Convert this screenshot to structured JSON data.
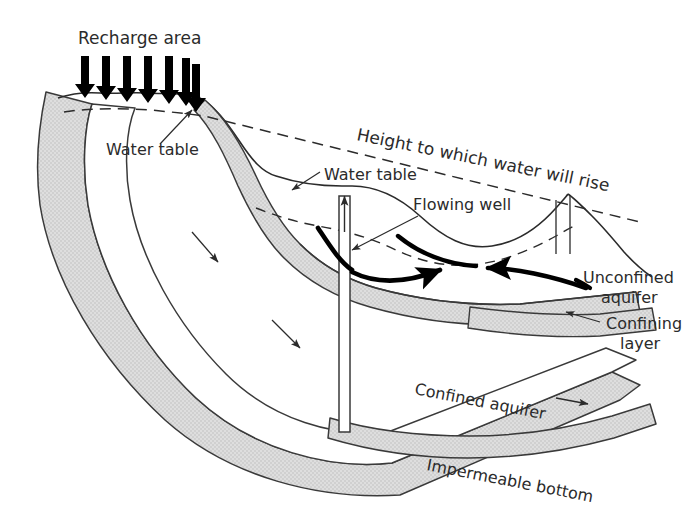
{
  "figure": {
    "kind": "geologic-cross-section",
    "canvas": {
      "width": 697,
      "height": 524
    }
  },
  "colors": {
    "background": "#ffffff",
    "ink": "#1a1a1a",
    "text": "#2b2b2b",
    "confining_layer_fill": "#dcdcdc",
    "confining_layer_stroke": "#3a3a3a",
    "aquifer_fill": "#ffffff",
    "dashed_line": "#2b2b2b",
    "thick_arrow": "#000000"
  },
  "labels": {
    "recharge_area": "Recharge area",
    "water_table_left": "Water table",
    "water_table_mid": "Water table",
    "height_to_which_water_will_rise": "Height to which water will rise",
    "flowing_well": "Flowing well",
    "unconfined_aquifer_line1": "Unconfined",
    "unconfined_aquifer_line2": "aquifer",
    "confining_layer_line1": "Confining",
    "confining_layer_line2": "layer",
    "confined_aquifer": "Confined aquifer",
    "impermeable_bottom": "Impermeable bottom"
  },
  "label_positions": {
    "recharge_area": {
      "x": 78,
      "y": 44,
      "rotate": 0,
      "size": 17
    },
    "water_table_left": {
      "x": 106,
      "y": 155,
      "rotate": 0,
      "size": 16
    },
    "water_table_mid": {
      "x": 320,
      "y": 180,
      "rotate": 0,
      "size": 16
    },
    "height_label": {
      "x": 356,
      "y": 140,
      "rotate": 11.5,
      "size": 17
    },
    "flowing_well": {
      "x": 413,
      "y": 210,
      "rotate": 0,
      "size": 16
    },
    "unconfined_aquifer": {
      "x": 583,
      "y": 283,
      "rotate": 0,
      "size": 16
    },
    "confining_layer": {
      "x": 606,
      "y": 329,
      "rotate": 0,
      "size": 16
    },
    "confined_aquifer": {
      "x": 414,
      "y": 394,
      "rotate": 11.0,
      "size": 16
    },
    "impermeable_bottom": {
      "x": 426,
      "y": 470,
      "rotate": 11.0,
      "size": 16
    }
  },
  "recharge_arrows": {
    "count": 7,
    "description": "downward arrows showing precipitation infiltrating the recharge area",
    "x_positions": [
      85,
      106,
      127,
      148,
      169,
      186,
      196
    ],
    "y_top": 56,
    "y_tip": [
      94,
      97,
      99,
      100,
      101,
      102,
      106
    ]
  },
  "features": [
    {
      "name": "flowing-well",
      "type": "well",
      "x": 345,
      "y_top": 196,
      "y_bottom": 430,
      "note": "artesian well tapping the confined aquifer; water rises above ground surface"
    },
    {
      "name": "surface-notch",
      "type": "valley",
      "x": 566,
      "note": "notch in land surface, unconfined aquifer outcrop"
    }
  ],
  "flow_indicators": {
    "confined_aquifer_thin_arrows": 2,
    "unconfined_thick_arrows": 2,
    "well_discharge_arrow": 1,
    "confined_aquifer_direction_arrow": 1
  },
  "legend_note": "Gray stippled bands are low-permeability confining layers; white bands are aquifers."
}
